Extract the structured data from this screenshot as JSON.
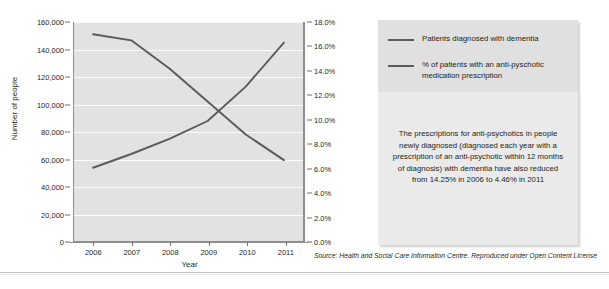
{
  "chart_data": {
    "type": "line",
    "title": "",
    "xlabel": "Year",
    "ylabel": "Number of people",
    "ylabel_right": "",
    "grid": true,
    "legend_position": "right",
    "categories": [
      "2006",
      "2007",
      "2008",
      "2009",
      "2010",
      "2011"
    ],
    "x": [
      2006,
      2007,
      2008,
      2009,
      2010,
      2011
    ],
    "axes": {
      "left": {
        "label": "Number of people",
        "min": 0,
        "max": 160000,
        "step": 20000,
        "ticks": [
          "0",
          "20,000",
          "40,000",
          "60,000",
          "80,000",
          "100,000",
          "120,000",
          "140,000",
          "160,000"
        ],
        "tick_values": [
          0,
          20000,
          40000,
          60000,
          80000,
          100000,
          120000,
          140000,
          160000
        ]
      },
      "right": {
        "label": "",
        "min": 0,
        "max": 18,
        "step": 2,
        "ticks": [
          "0.0%",
          "2.0%",
          "4.0%",
          "6.0%",
          "8.0%",
          "10.0%",
          "12.0%",
          "14.0%",
          "16.0%",
          "18.0%"
        ],
        "tick_values": [
          0,
          2,
          4,
          6,
          8,
          10,
          12,
          14,
          16,
          18
        ]
      },
      "x": {
        "label": "Year",
        "ticks": [
          "2006",
          "2007",
          "2008",
          "2009",
          "2010",
          "2011"
        ]
      }
    },
    "series": [
      {
        "name": "Patients diagnosed with dementia",
        "axis": "left",
        "color": "#5a5a5a",
        "values": [
          54000,
          64000,
          75000,
          88000,
          113000,
          145000
        ]
      },
      {
        "name": "% of patients with an anti-pyschotic medication prescription",
        "axis": "right",
        "color": "#5a5a5a",
        "values": [
          17.0,
          16.5,
          14.2,
          11.5,
          8.8,
          6.7
        ]
      }
    ]
  },
  "legend": {
    "items": [
      {
        "label": "Patients diagnosed with dementia",
        "color": "#5a5a5a"
      },
      {
        "label": "% of patients with an anti-pyschotic medication prescription",
        "color": "#5a5a5a"
      }
    ]
  },
  "note": {
    "text": "The prescriptions for anti-psychotics in people newly diagnosed (diagnosed each year with a prescription of an anti-psychotic within 12 months of diagnosis) with dementia have also reduced from 14.25% in 2006 to 4.46% in 2011"
  },
  "source": {
    "text": "Source: Health and Social Care Information Centre. Reproduced under Open Content License"
  },
  "colors": {
    "plot_background": "#e2e2e2",
    "gridline": "#fbfbfb",
    "axis": "#8d8d8d",
    "line": "#5a5a5a",
    "panel_legend_bg": "#e0e0e0",
    "panel_note_bg": "#eaeaea",
    "text": "#231f20"
  }
}
